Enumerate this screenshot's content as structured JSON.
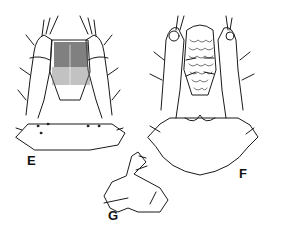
{
  "figure": {
    "panels": [
      {
        "id": "E",
        "label": "E"
      },
      {
        "id": "F",
        "label": "F"
      },
      {
        "id": "G",
        "label": "G"
      }
    ],
    "ink_color": "#1a1a1a",
    "background": "#ffffff"
  }
}
